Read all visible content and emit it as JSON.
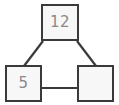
{
  "diagram": {
    "type": "node-link-diagram",
    "canvas": {
      "width": 119,
      "height": 105
    },
    "colors": {
      "background": "#ffffff",
      "node_fill": "#f7f7f7",
      "node_border": "#3a3a3a",
      "edge_stroke": "#3a3a3a",
      "label_text": "#8a8a8a"
    },
    "nodes": [
      {
        "id": "top",
        "label": "12",
        "empty": false,
        "x": 41,
        "y": 4,
        "width": 38,
        "height": 37
      },
      {
        "id": "bottom-left",
        "label": "5",
        "empty": false,
        "x": 5,
        "y": 65,
        "width": 37,
        "height": 37
      },
      {
        "id": "bottom-right",
        "label": "",
        "empty": true,
        "x": 77,
        "y": 65,
        "width": 37,
        "height": 37
      }
    ],
    "edges": [
      {
        "id": "top-to-bottom-left",
        "from": "top",
        "to": "bottom-left",
        "style": "diagonal"
      },
      {
        "id": "top-to-bottom-right",
        "from": "top",
        "to": "bottom-right",
        "style": "diagonal"
      },
      {
        "id": "bottom-left-to-bottom-right",
        "from": "bottom-left",
        "to": "bottom-right",
        "style": "horizontal"
      }
    ]
  }
}
